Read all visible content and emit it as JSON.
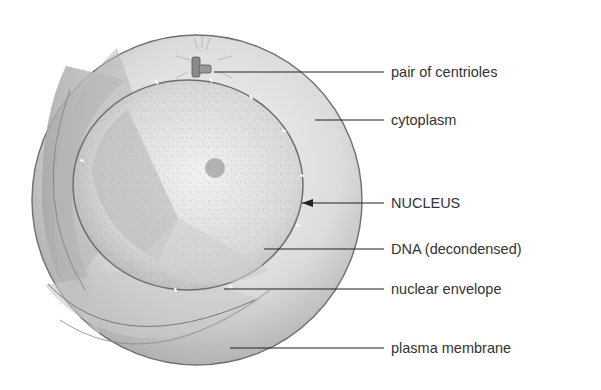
{
  "diagram": {
    "labels": [
      {
        "id": "centrioles",
        "text": "pair of centrioles",
        "y": 72,
        "line_from_x": 214,
        "arrow": false
      },
      {
        "id": "cytoplasm",
        "text": "cytoplasm",
        "y": 120,
        "line_from_x": 315,
        "arrow": false
      },
      {
        "id": "nucleus",
        "text": "NUCLEUS",
        "y": 203,
        "line_from_x": 302,
        "arrow": true
      },
      {
        "id": "dna",
        "text": "DNA (decondensed)",
        "y": 249,
        "line_from_x": 264,
        "arrow": false
      },
      {
        "id": "nuclear-envelope",
        "text": "nuclear envelope",
        "y": 289,
        "line_from_x": 224,
        "arrow": false
      },
      {
        "id": "plasma-membrane",
        "text": "plasma membrane",
        "y": 348,
        "line_from_x": 230,
        "arrow": false
      }
    ]
  }
}
